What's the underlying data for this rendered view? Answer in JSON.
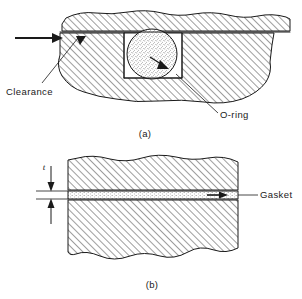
{
  "figure": {
    "background_color": "#ffffff",
    "line_color": "#1a1a1a",
    "hatch_color": "#1a1a1a"
  },
  "diagram_a": {
    "caption": "(a)",
    "labels": {
      "clearance": "Clearance",
      "oring": "O-ring"
    },
    "icons": {
      "pressure_arrow": "pressure-arrow-icon",
      "clearance_arrow": "clearance-arrow-icon",
      "extrusion_arrow": "extrusion-arrow-icon"
    }
  },
  "diagram_b": {
    "caption": "(b)",
    "labels": {
      "gasket": "Gasket",
      "thickness": "t"
    },
    "icons": {
      "dimension_arrow_top": "dimension-arrow-down-icon",
      "dimension_arrow_bottom": "dimension-arrow-up-icon",
      "gasket_pointer_arrow": "gasket-pointer-arrow-icon"
    }
  }
}
